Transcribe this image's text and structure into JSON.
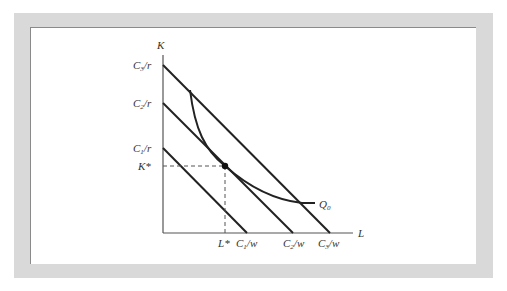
{
  "figure": {
    "axes": {
      "y_label": "K",
      "x_label": "L"
    },
    "y_ticks": [
      {
        "main": "C",
        "sub": "3",
        "rest": "/r"
      },
      {
        "main": "C",
        "sub": "2",
        "rest": "/r"
      },
      {
        "main": "C",
        "sub": "1",
        "rest": "/r"
      },
      {
        "main": "K",
        "sub": "",
        "rest": "*"
      }
    ],
    "x_ticks": [
      {
        "main": "L",
        "sub": "",
        "rest": "*"
      },
      {
        "main": "C",
        "sub": "1",
        "rest": "/w"
      },
      {
        "main": "C",
        "sub": "2",
        "rest": "/w"
      },
      {
        "main": "C",
        "sub": "3",
        "rest": "/w"
      }
    ],
    "isoquant_label": {
      "main": "Q",
      "sub": "0"
    },
    "colors": {
      "frame": "#d9d9d9",
      "line": "#222222",
      "dashed": "#555555"
    }
  }
}
